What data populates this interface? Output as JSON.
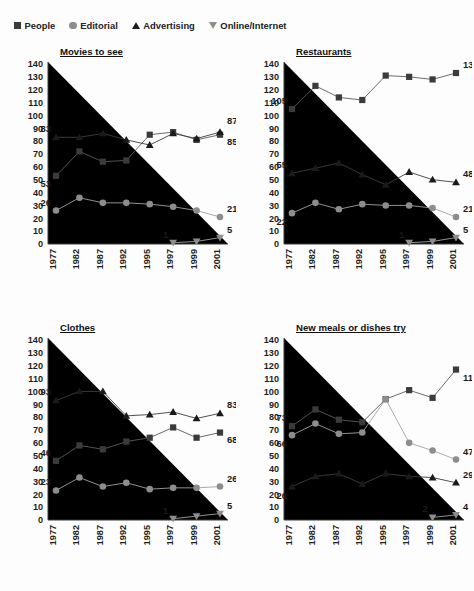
{
  "top_note": "",
  "legend": {
    "items": [
      {
        "label": "People",
        "marker": "square-marker-icon",
        "color": "#3b3b3b"
      },
      {
        "label": "Editorial",
        "marker": "circle-marker-icon",
        "color": "#8d8d8d"
      },
      {
        "label": "Advertising",
        "marker": "triangle-up-marker-icon",
        "color": "#1a1a1a"
      },
      {
        "label": "Online/Internet",
        "marker": "triangle-down-marker-icon",
        "color": "#8d8d8d"
      }
    ]
  },
  "chart_data": [
    {
      "type": "line",
      "title": "Movies to see",
      "xlabel": "",
      "ylabel": "",
      "ylim": [
        0,
        140
      ],
      "yticks": [
        0,
        10,
        20,
        30,
        40,
        50,
        60,
        70,
        80,
        90,
        100,
        110,
        120,
        130,
        140
      ],
      "grid": false,
      "legend_position": "top",
      "categories": [
        "1977",
        "1982",
        "1987",
        "1992",
        "1995",
        "1997",
        "1999",
        "2001"
      ],
      "series": [
        {
          "name": "People",
          "values": [
            53,
            72,
            64,
            65,
            85,
            87,
            81,
            85
          ],
          "annotations": {
            "0": "53",
            "7": "85"
          }
        },
        {
          "name": "Editorial",
          "values": [
            26,
            36,
            32,
            32,
            31,
            29,
            26,
            21
          ],
          "annotations": {
            "0": "26",
            "7": "21"
          }
        },
        {
          "name": "Advertising",
          "values": [
            83,
            83,
            86,
            81,
            77,
            86,
            82,
            87
          ],
          "annotations": {
            "0": "83",
            "7": "87"
          }
        },
        {
          "name": "Online/Internet",
          "values": [
            null,
            null,
            null,
            null,
            null,
            1,
            2,
            5
          ],
          "annotations": {
            "5": "1",
            "7": "5"
          }
        }
      ]
    },
    {
      "type": "line",
      "title": "Restaurants",
      "xlabel": "",
      "ylabel": "",
      "ylim": [
        0,
        140
      ],
      "yticks": [
        0,
        10,
        20,
        30,
        40,
        50,
        60,
        70,
        80,
        90,
        100,
        110,
        120,
        130,
        140
      ],
      "grid": false,
      "legend_position": "top",
      "categories": [
        "1977",
        "1982",
        "1987",
        "1992",
        "1995",
        "1997",
        "1999",
        "2001"
      ],
      "series": [
        {
          "name": "People",
          "values": [
            105,
            123,
            114,
            112,
            131,
            130,
            128,
            133
          ],
          "annotations": {
            "0": "105",
            "7": "133"
          }
        },
        {
          "name": "Editorial",
          "values": [
            24,
            32,
            27,
            31,
            30,
            30,
            28,
            21
          ],
          "annotations": {
            "0": "22",
            "7": "21"
          }
        },
        {
          "name": "Advertising",
          "values": [
            55,
            59,
            63,
            54,
            46,
            56,
            50,
            48
          ],
          "annotations": {
            "0": "55",
            "7": "48"
          }
        },
        {
          "name": "Online/Internet",
          "values": [
            null,
            null,
            null,
            null,
            null,
            1,
            2,
            5
          ],
          "annotations": {
            "5": "1",
            "7": "5"
          }
        }
      ]
    },
    {
      "type": "line",
      "title": "Clothes",
      "xlabel": "",
      "ylabel": "",
      "ylim": [
        0,
        140
      ],
      "yticks": [
        0,
        10,
        20,
        30,
        40,
        50,
        60,
        70,
        80,
        90,
        100,
        110,
        120,
        130,
        140
      ],
      "grid": false,
      "legend_position": "top",
      "categories": [
        "1977",
        "1982",
        "1987",
        "1992",
        "1995",
        "1997",
        "1999",
        "2001"
      ],
      "series": [
        {
          "name": "People",
          "values": [
            46,
            58,
            55,
            61,
            64,
            72,
            64,
            68
          ],
          "annotations": {
            "0": "46",
            "7": "68"
          }
        },
        {
          "name": "Editorial",
          "values": [
            23,
            33,
            26,
            29,
            24,
            25,
            25,
            26
          ],
          "annotations": {
            "0": "23",
            "7": "26"
          }
        },
        {
          "name": "Advertising",
          "values": [
            93,
            100,
            100,
            81,
            82,
            84,
            79,
            83
          ],
          "annotations": {
            "0": "93",
            "7": "83"
          }
        },
        {
          "name": "Online/Internet",
          "values": [
            null,
            null,
            null,
            null,
            null,
            1,
            3,
            5
          ],
          "annotations": {
            "5": "1",
            "7": "5"
          }
        }
      ]
    },
    {
      "type": "line",
      "title": "New meals or dishes try",
      "xlabel": "",
      "ylabel": "",
      "ylim": [
        0,
        140
      ],
      "yticks": [
        0,
        10,
        20,
        30,
        40,
        50,
        60,
        70,
        80,
        90,
        100,
        110,
        120,
        130,
        140
      ],
      "grid": false,
      "legend_position": "top",
      "categories": [
        "1977",
        "1982",
        "1987",
        "1992",
        "1995",
        "1997",
        "1999",
        "2001"
      ],
      "series": [
        {
          "name": "People",
          "values": [
            73,
            86,
            78,
            76,
            94,
            101,
            95,
            117
          ],
          "annotations": {
            "0": "73",
            "7": "117"
          }
        },
        {
          "name": "Editorial",
          "values": [
            66,
            75,
            67,
            68,
            94,
            60,
            54,
            47
          ],
          "annotations": {
            "0": "66",
            "7": "47"
          }
        },
        {
          "name": "Advertising",
          "values": [
            26,
            34,
            36,
            28,
            36,
            34,
            33,
            29
          ],
          "annotations": {
            "0": "26",
            "7": "29"
          }
        },
        {
          "name": "Online/Internet",
          "values": [
            null,
            null,
            null,
            null,
            null,
            null,
            2,
            4
          ],
          "annotations": {
            "6": "2",
            "7": "4"
          }
        }
      ]
    }
  ]
}
